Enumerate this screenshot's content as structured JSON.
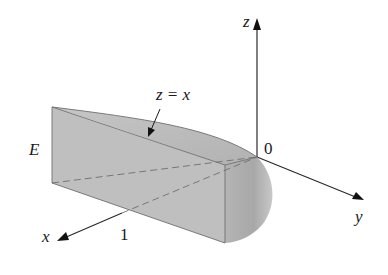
{
  "figure": {
    "region_label": "E",
    "surface_label": "z = x",
    "axes": {
      "x_label": "x",
      "y_label": "y",
      "z_label": "z",
      "origin_label": "0",
      "x_tick_label": "1"
    },
    "colors": {
      "solid_fill": "#bdbdbd",
      "solid_fill_dark": "#a9a9a9",
      "edge": "#6e6e6e",
      "axis": "#2a2a2a",
      "text": "#1a1a1a"
    }
  }
}
